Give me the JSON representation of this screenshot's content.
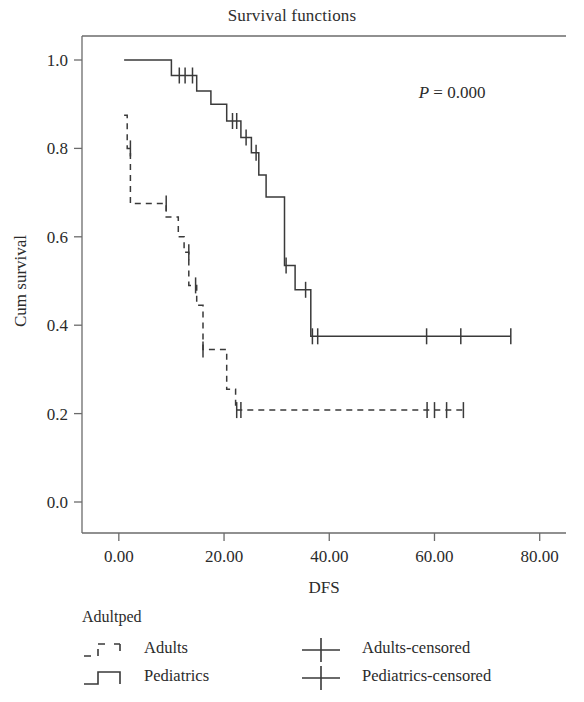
{
  "chart_data": {
    "type": "line",
    "subtype": "kaplan-meier-survival",
    "title": "Survival functions",
    "xlabel": "DFS",
    "ylabel": "Cum survival",
    "xlim": [
      -7,
      85
    ],
    "ylim": [
      0.0,
      1.05
    ],
    "xticks": [
      0,
      20,
      40,
      60,
      80
    ],
    "xtick_labels": [
      "0.00",
      "20.00",
      "40.00",
      "60.00",
      "80.00"
    ],
    "yticks": [
      0.0,
      0.2,
      0.4,
      0.6,
      0.8,
      1.0
    ],
    "ytick_labels": [
      "0.0",
      "0.2",
      "0.4",
      "0.6",
      "0.8",
      "1.0"
    ],
    "grid": false,
    "annotations": [
      {
        "name": "p-value",
        "text_italic": "P",
        "text": " = 0.000",
        "x": 57,
        "y": 0.915
      }
    ],
    "legend": {
      "position": "below-plot",
      "title": "Adultped",
      "entries": [
        {
          "label": "Adults",
          "style": "dashed-step",
          "marker": "none"
        },
        {
          "label": "Pediatrics",
          "style": "solid-step",
          "marker": "none"
        },
        {
          "label": "Adults-censored",
          "style": "censor",
          "marker": "plus"
        },
        {
          "label": "Pediatrics-censored",
          "style": "censor",
          "marker": "plus"
        }
      ]
    },
    "series": [
      {
        "name": "Pediatrics",
        "style": "solid",
        "color": "#3a3a3a",
        "points": [
          [
            1.0,
            1.0
          ],
          [
            10.0,
            1.0
          ],
          [
            10.0,
            0.965
          ],
          [
            14.8,
            0.965
          ],
          [
            14.8,
            0.93
          ],
          [
            17.5,
            0.93
          ],
          [
            17.5,
            0.9
          ],
          [
            20.5,
            0.9
          ],
          [
            20.5,
            0.862
          ],
          [
            23.2,
            0.862
          ],
          [
            23.2,
            0.825
          ],
          [
            25.2,
            0.825
          ],
          [
            25.2,
            0.79
          ],
          [
            26.6,
            0.79
          ],
          [
            26.6,
            0.74
          ],
          [
            28.0,
            0.74
          ],
          [
            28.0,
            0.69
          ],
          [
            31.5,
            0.69
          ],
          [
            31.5,
            0.535
          ],
          [
            33.5,
            0.535
          ],
          [
            33.5,
            0.48
          ],
          [
            36.5,
            0.48
          ],
          [
            36.5,
            0.375
          ],
          [
            74.5,
            0.375
          ]
        ],
        "censored_times": [
          [
            11.5,
            0.965
          ],
          [
            12.6,
            0.965
          ],
          [
            14.0,
            0.965
          ],
          [
            21.6,
            0.862
          ],
          [
            22.4,
            0.862
          ],
          [
            24.2,
            0.825
          ],
          [
            26.1,
            0.79
          ],
          [
            31.8,
            0.535
          ],
          [
            35.5,
            0.48
          ],
          [
            36.8,
            0.375
          ],
          [
            37.8,
            0.375
          ],
          [
            58.5,
            0.375
          ],
          [
            65.0,
            0.375
          ],
          [
            74.5,
            0.375
          ]
        ]
      },
      {
        "name": "Adults",
        "style": "dashed",
        "color": "#3a3a3a",
        "points": [
          [
            1.0,
            0.875
          ],
          [
            1.6,
            0.875
          ],
          [
            1.6,
            0.8
          ],
          [
            2.2,
            0.8
          ],
          [
            2.2,
            0.675
          ],
          [
            9.0,
            0.675
          ],
          [
            9.0,
            0.645
          ],
          [
            11.3,
            0.645
          ],
          [
            11.3,
            0.6
          ],
          [
            12.4,
            0.6
          ],
          [
            12.4,
            0.565
          ],
          [
            13.3,
            0.565
          ],
          [
            13.3,
            0.49
          ],
          [
            14.8,
            0.49
          ],
          [
            14.8,
            0.445
          ],
          [
            16.0,
            0.445
          ],
          [
            16.0,
            0.345
          ],
          [
            20.5,
            0.345
          ],
          [
            20.5,
            0.255
          ],
          [
            22.2,
            0.255
          ],
          [
            22.2,
            0.208
          ],
          [
            65.5,
            0.208
          ]
        ],
        "censored_times": [
          [
            2.2,
            0.8
          ],
          [
            9.0,
            0.675
          ],
          [
            13.3,
            0.565
          ],
          [
            14.6,
            0.49
          ],
          [
            16.0,
            0.345
          ],
          [
            22.4,
            0.208
          ],
          [
            23.2,
            0.208
          ],
          [
            58.6,
            0.208
          ],
          [
            60.0,
            0.208
          ],
          [
            62.3,
            0.208
          ],
          [
            65.5,
            0.208
          ]
        ]
      }
    ]
  }
}
